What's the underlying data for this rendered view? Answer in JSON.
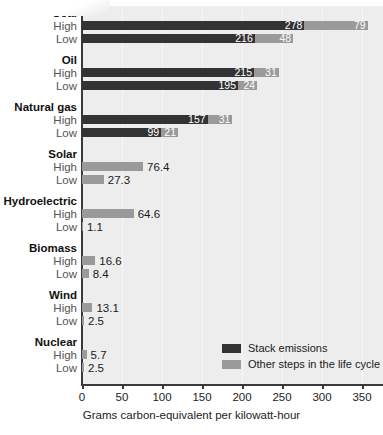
{
  "chart_data": {
    "type": "bar",
    "orientation": "horizontal",
    "stacked": true,
    "title": "",
    "xlabel": "Grams carbon-equivalent per kilowatt-hour",
    "ylabel": "",
    "xlim": [
      0,
      375
    ],
    "xticks": [
      0,
      50,
      100,
      150,
      200,
      250,
      300,
      350
    ],
    "grid": true,
    "legend_position": "inside-bottom-right",
    "series": [
      {
        "name": "Stack emissions",
        "color": "#333333"
      },
      {
        "name": "Other steps in the life cycle",
        "color": "#9a9a9a"
      }
    ],
    "groups": [
      {
        "name": "Coal",
        "rows": [
          {
            "label": "High",
            "stack": 278,
            "other": 79
          },
          {
            "label": "Low",
            "stack": 216,
            "other": 48
          }
        ]
      },
      {
        "name": "Oil",
        "rows": [
          {
            "label": "High",
            "stack": 215,
            "other": 31
          },
          {
            "label": "Low",
            "stack": 195,
            "other": 24
          }
        ]
      },
      {
        "name": "Natural gas",
        "rows": [
          {
            "label": "High",
            "stack": 157,
            "other": 31
          },
          {
            "label": "Low",
            "stack": 99,
            "other": 21
          }
        ]
      },
      {
        "name": "Solar",
        "rows": [
          {
            "label": "High",
            "stack": 0,
            "other": 76.4
          },
          {
            "label": "Low",
            "stack": 0,
            "other": 27.3
          }
        ]
      },
      {
        "name": "Hydroelectric",
        "rows": [
          {
            "label": "High",
            "stack": 0,
            "other": 64.6
          },
          {
            "label": "Low",
            "stack": 0,
            "other": 1.1
          }
        ]
      },
      {
        "name": "Biomass",
        "rows": [
          {
            "label": "High",
            "stack": 0,
            "other": 16.6
          },
          {
            "label": "Low",
            "stack": 0,
            "other": 8.4
          }
        ]
      },
      {
        "name": "Wind",
        "rows": [
          {
            "label": "High",
            "stack": 0,
            "other": 13.1
          },
          {
            "label": "Low",
            "stack": 0,
            "other": 2.5
          }
        ]
      },
      {
        "name": "Nuclear",
        "rows": [
          {
            "label": "High",
            "stack": 0,
            "other": 5.7
          },
          {
            "label": "Low",
            "stack": 0,
            "other": 2.5
          }
        ]
      }
    ]
  },
  "legend": {
    "items": [
      {
        "label": "Stack emissions",
        "color": "#333333"
      },
      {
        "label": "Other steps in the life cycle",
        "color": "#9a9a9a"
      }
    ]
  },
  "axis": {
    "xlabel": "Grams carbon-equivalent per kilowatt-hour",
    "ticks": [
      "0",
      "50",
      "100",
      "150",
      "200",
      "250",
      "300",
      "350"
    ]
  },
  "colors": {
    "stack": "#333333",
    "other": "#9a9a9a",
    "plot_background": "#ededed",
    "axis": "#3a3a3a",
    "group_label": "#111111",
    "row_label": "#555555"
  }
}
